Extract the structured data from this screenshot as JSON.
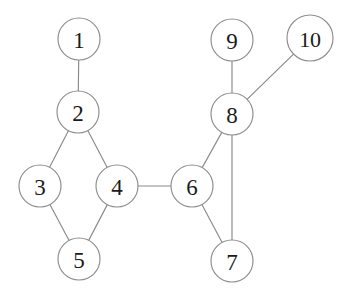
{
  "diagram": {
    "type": "node-link-graph",
    "width": 346,
    "height": 300,
    "background_color": "#ffffff",
    "node_fill_color": "#ffffff",
    "node_stroke_color": "#8d8d8d",
    "edge_color": "#8a8a8a",
    "label_color": "#1b1b1b"
  },
  "nodes": [
    {
      "id": 1,
      "label": "1",
      "cx": 79,
      "cy": 39,
      "r": 21
    },
    {
      "id": 2,
      "label": "2",
      "cx": 78,
      "cy": 112,
      "r": 21
    },
    {
      "id": 3,
      "label": "3",
      "cx": 40,
      "cy": 186,
      "r": 21
    },
    {
      "id": 4,
      "label": "4",
      "cx": 117,
      "cy": 186,
      "r": 21
    },
    {
      "id": 5,
      "label": "5",
      "cx": 79,
      "cy": 259,
      "r": 21
    },
    {
      "id": 6,
      "label": "6",
      "cx": 192,
      "cy": 186,
      "r": 21
    },
    {
      "id": 7,
      "label": "7",
      "cx": 232,
      "cy": 261,
      "r": 21
    },
    {
      "id": 8,
      "label": "8",
      "cx": 232,
      "cy": 114,
      "r": 21
    },
    {
      "id": 9,
      "label": "9",
      "cx": 232,
      "cy": 40,
      "r": 21
    },
    {
      "id": 10,
      "label": "10",
      "cx": 310,
      "cy": 38,
      "r": 23
    }
  ],
  "edges": [
    {
      "source": 1,
      "target": 2,
      "name": "edge-1-2"
    },
    {
      "source": 2,
      "target": 3,
      "name": "edge-2-3"
    },
    {
      "source": 2,
      "target": 4,
      "name": "edge-2-4"
    },
    {
      "source": 3,
      "target": 5,
      "name": "edge-3-5"
    },
    {
      "source": 4,
      "target": 5,
      "name": "edge-4-5"
    },
    {
      "source": 4,
      "target": 6,
      "name": "edge-4-6"
    },
    {
      "source": 6,
      "target": 7,
      "name": "edge-6-7"
    },
    {
      "source": 6,
      "target": 8,
      "name": "edge-6-8"
    },
    {
      "source": 7,
      "target": 8,
      "name": "edge-7-8"
    },
    {
      "source": 8,
      "target": 9,
      "name": "edge-8-9"
    },
    {
      "source": 8,
      "target": 10,
      "name": "edge-8-10"
    }
  ]
}
